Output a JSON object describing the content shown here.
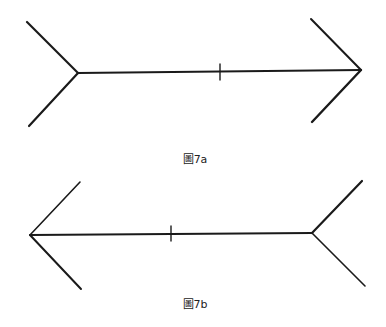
{
  "figures": [
    {
      "id": "7a",
      "caption": "圖7a",
      "caption_pos": {
        "x": 195,
        "y": 150
      },
      "description": "Müller-Lyer figure with outward fins on left and inward arrowhead on right; tick mark on shaft",
      "shaft": {
        "x1": 78,
        "y1": 73,
        "x2": 361,
        "y2": 70,
        "width": 1.8
      },
      "left_fins": [
        {
          "x1": 78,
          "y1": 73,
          "x2": 27,
          "y2": 22,
          "width": 2.2
        },
        {
          "x1": 78,
          "y1": 73,
          "x2": 29,
          "y2": 126,
          "width": 2.2
        }
      ],
      "right_fins": [
        {
          "x1": 361,
          "y1": 70,
          "x2": 311,
          "y2": 19,
          "width": 2.0
        },
        {
          "x1": 361,
          "y1": 70,
          "x2": 312,
          "y2": 122,
          "width": 2.4
        }
      ],
      "tick": {
        "x1": 220,
        "y1": 64,
        "x2": 220,
        "y2": 80,
        "width": 1.4
      }
    },
    {
      "id": "7b",
      "caption": "圖7b",
      "caption_pos": {
        "x": 195,
        "y": 295
      },
      "description": "Müller-Lyer figure with arrowhead on left and outward fins on right; tick mark on shaft",
      "shaft": {
        "x1": 30,
        "y1": 235,
        "x2": 312,
        "y2": 233,
        "width": 1.8
      },
      "left_fins": [
        {
          "x1": 30,
          "y1": 235,
          "x2": 80,
          "y2": 182,
          "width": 1.6
        },
        {
          "x1": 30,
          "y1": 235,
          "x2": 81,
          "y2": 289,
          "width": 2.0
        }
      ],
      "right_fins": [
        {
          "x1": 312,
          "y1": 233,
          "x2": 362,
          "y2": 181,
          "width": 2.2
        },
        {
          "x1": 312,
          "y1": 233,
          "x2": 365,
          "y2": 286,
          "width": 1.6
        }
      ],
      "tick": {
        "x1": 171,
        "y1": 226,
        "x2": 171,
        "y2": 241,
        "width": 1.4
      }
    }
  ],
  "colors": {
    "stroke": "#1a1a1a",
    "background": "#ffffff",
    "text": "#222222"
  }
}
